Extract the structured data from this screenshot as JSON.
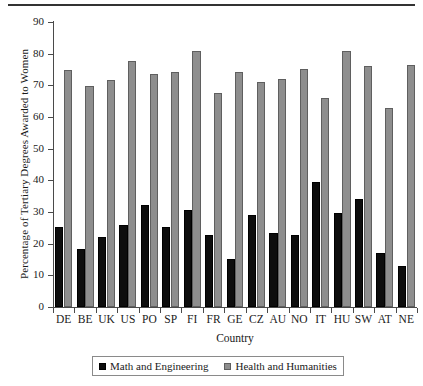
{
  "chart_data": {
    "type": "bar",
    "title": "",
    "xlabel": "Country",
    "ylabel": "Percentage of Tertiary Degrees Awarded to Women",
    "ylim": [
      0,
      90
    ],
    "ytick_step": 10,
    "yticks": [
      0,
      10,
      20,
      30,
      40,
      50,
      60,
      70,
      80,
      90
    ],
    "grid": false,
    "legend_position": "bottom-center",
    "categories": [
      "DE",
      "BE",
      "UK",
      "US",
      "PO",
      "SP",
      "FI",
      "FR",
      "GE",
      "CZ",
      "AU",
      "NO",
      "IT",
      "HU",
      "SW",
      "AT",
      "NE"
    ],
    "series": [
      {
        "name": "Math and Engineering",
        "color": "#0d0d0d",
        "values": [
          25.2,
          18.2,
          22.0,
          25.9,
          32.3,
          25.4,
          30.7,
          22.8,
          15.1,
          28.9,
          23.3,
          22.6,
          39.5,
          29.8,
          34.0,
          17.2,
          12.9
        ]
      },
      {
        "name": "Health and Humanities",
        "color": "#8e8e8e",
        "values": [
          74.8,
          69.9,
          71.8,
          77.7,
          73.7,
          74.1,
          81.0,
          67.7,
          74.1,
          71.2,
          71.9,
          75.3,
          66.1,
          80.7,
          76.2,
          62.8,
          76.5
        ]
      }
    ]
  },
  "legend": {
    "entries": [
      {
        "label": "Math and Engineering"
      },
      {
        "label": "Health and Humanities"
      }
    ]
  }
}
